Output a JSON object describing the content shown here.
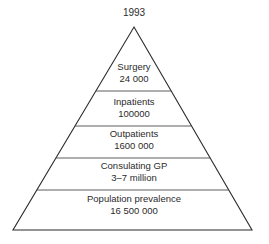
{
  "figure": {
    "title": "1993",
    "shape": "triangle-pyramid",
    "background_color": "#ffffff",
    "line_color": "#2b2b2b",
    "text_color": "#2b2b2b"
  },
  "chart_data": {
    "type": "pyramid",
    "title": "1993",
    "xlabel": "",
    "ylabel": "",
    "grid": false,
    "legend": "none",
    "orientation": "apex-up",
    "apex": {
      "x": 134,
      "y": 27
    },
    "base_left": {
      "x": 13,
      "y": 230
    },
    "base_right": {
      "x": 252,
      "y": 230
    },
    "divider_y": [
      91,
      126,
      158,
      190
    ],
    "categories": [
      "Surgery",
      "Inpatients",
      "Outpatients",
      "Consulating GP",
      "Population prevalence"
    ],
    "value_labels": [
      "24 000",
      "100000",
      "1600 000",
      "3–7 million",
      "16 500 000"
    ],
    "values": [
      24000,
      100000,
      1600000,
      5000000,
      16500000
    ],
    "tiers": [
      {
        "index": 0,
        "label": "Surgery",
        "value_label": "24 000",
        "value": 24000,
        "label_x": 134,
        "label_y": 70,
        "value_y": 82
      },
      {
        "index": 1,
        "label": "Inpatients",
        "value_label": "100000",
        "value": 100000,
        "label_x": 134,
        "label_y": 105,
        "value_y": 117
      },
      {
        "index": 2,
        "label": "Outpatients",
        "value_label": "1600 000",
        "value": 1600000,
        "label_x": 134,
        "label_y": 137,
        "value_y": 149
      },
      {
        "index": 3,
        "label": "Consulating GP",
        "value_label": "3–7 million",
        "value": 5000000,
        "label_x": 134,
        "label_y": 169,
        "value_y": 181
      },
      {
        "index": 4,
        "label": "Population prevalence",
        "value_label": "16 500 000",
        "value": 16500000,
        "label_x": 134,
        "label_y": 202,
        "value_y": 214
      }
    ]
  }
}
